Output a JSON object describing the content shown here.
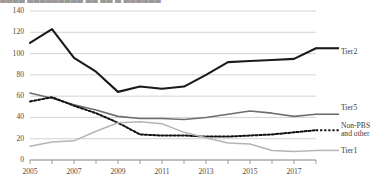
{
  "title_fragment": "█▄█▄  ▄█▄█▄█▄█▄ ▄█ ▄█ ▄ ▄█▄█▄█",
  "axes": {
    "y_ticks": [
      "0",
      "20",
      "40",
      "60",
      "80",
      "100",
      "120",
      "140"
    ],
    "x_ticks": [
      "2005",
      "2007",
      "2009",
      "2011",
      "2013",
      "2015",
      "2017"
    ]
  },
  "series_labels": {
    "tier2": "Tier2",
    "tier5": "Tier5",
    "nonpbs_line1": "Non-PBS",
    "nonpbs_line2": "and other",
    "tier1": "Tier1"
  },
  "colors": {
    "tier2": "#1a1a1a",
    "tier5": "#6e6e6e",
    "nonpbs": "#111111",
    "tier1": "#b5b5b5",
    "gridline": "#c8c8c8",
    "axis": "#8c8c8c",
    "text": "#3b3b3b"
  },
  "chart_data": {
    "type": "line",
    "title": "",
    "xlabel": "",
    "ylabel": "",
    "ylim": [
      0,
      140
    ],
    "ytick_step": 20,
    "grid": true,
    "legend_position": "right-inline-labels",
    "x": [
      2005,
      2006,
      2007,
      2008,
      2009,
      2010,
      2011,
      2012,
      2013,
      2014,
      2015,
      2016,
      2017,
      2018
    ],
    "x_tick_labels": [
      "2005",
      "",
      "2007",
      "",
      "2009",
      "",
      "2011",
      "",
      "2013",
      "",
      "2015",
      "",
      "2017",
      ""
    ],
    "series": [
      {
        "name": "Tier2",
        "style": "solid-thick",
        "color": "#1a1a1a",
        "values": [
          110,
          123,
          96,
          83,
          64,
          69,
          67,
          69,
          80,
          92,
          93,
          94,
          95,
          105
        ]
      },
      {
        "name": "Tier5",
        "style": "solid-medium",
        "color": "#6e6e6e",
        "values": [
          63,
          58,
          52,
          47,
          41,
          39,
          39,
          38,
          40,
          43,
          46,
          44,
          41,
          43
        ]
      },
      {
        "name": "Non-PBS and other",
        "style": "dotted",
        "color": "#111111",
        "values": [
          55,
          59,
          51,
          44,
          35,
          24,
          23,
          23,
          22,
          22,
          23,
          24,
          26,
          28
        ]
      },
      {
        "name": "Tier1",
        "style": "solid-light",
        "color": "#b5b5b5",
        "values": [
          13,
          17,
          18,
          27,
          35,
          36,
          34,
          26,
          21,
          16,
          15,
          9,
          8,
          9
        ]
      }
    ]
  }
}
